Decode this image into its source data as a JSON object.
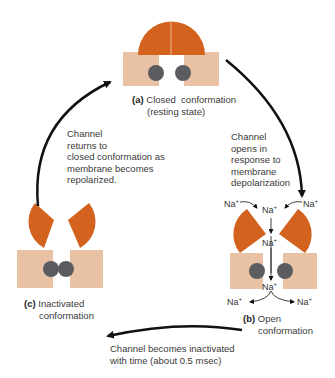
{
  "colors": {
    "gate": "#d2621e",
    "block": "#e9c2a6",
    "ion_dot": "#5a5c60",
    "arrow": "#111111",
    "text": "#3a3a3a"
  },
  "states": {
    "closed": {
      "letter": "(a)",
      "title": "Closed  conformation",
      "subtitle": "(resting state)"
    },
    "open": {
      "letter": "(b)",
      "title": "Open",
      "subtitle": "conformation"
    },
    "inactivated": {
      "letter": "(c)",
      "title": "Inactivated",
      "subtitle": "conformation"
    }
  },
  "transitions": {
    "closed_to_open": [
      "Channel",
      "opens in",
      "response to",
      "membrane",
      "depolarization"
    ],
    "open_to_inactivated": [
      "Channel becomes inactivated",
      "with time (about 0.5 msec)"
    ],
    "inactivated_to_closed": [
      "Channel",
      "returns to",
      "closed conformation as",
      "membrane becomes",
      "repolarized."
    ]
  },
  "ion": {
    "symbol": "Na",
    "charge": "+"
  }
}
